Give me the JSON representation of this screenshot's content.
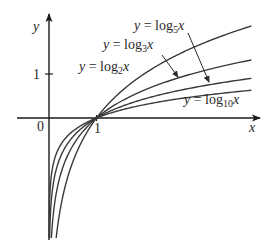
{
  "chart_data": {
    "type": "line",
    "title": "",
    "xlabel": "x",
    "ylabel": "y",
    "origin_label": "0",
    "x_ticks": [
      {
        "value": 1,
        "label": "1"
      }
    ],
    "y_ticks": [
      {
        "value": 1,
        "label": "1"
      }
    ],
    "xlim": [
      0,
      4.26
    ],
    "ylim": [
      -2.72,
      2.1
    ],
    "grid": false,
    "legend": "inline annotations with arrows",
    "series": [
      {
        "name": "y = log2x",
        "base": 2,
        "label_prefix": "y = log",
        "label_sub": "2",
        "label_suffix": "x",
        "points": [
          [
            0.27,
            -1.89
          ],
          [
            0.5,
            -1.0
          ],
          [
            1,
            0
          ],
          [
            2,
            1.0
          ],
          [
            3,
            1.585
          ],
          [
            4,
            2.0
          ],
          [
            4.26,
            2.09
          ]
        ]
      },
      {
        "name": "y = log3x",
        "base": 3,
        "label_prefix": "y = log",
        "label_sub": "3",
        "label_suffix": "x",
        "points": [
          [
            0.05,
            -2.73
          ],
          [
            0.5,
            -0.63
          ],
          [
            1,
            0
          ],
          [
            2,
            0.63
          ],
          [
            3,
            1.0
          ],
          [
            4,
            1.26
          ],
          [
            4.26,
            1.32
          ]
        ]
      },
      {
        "name": "y = log5x",
        "base": 5,
        "label_prefix": "y = log",
        "label_sub": "5",
        "label_suffix": "x",
        "points": [
          [
            0.013,
            -2.7
          ],
          [
            0.5,
            -0.43
          ],
          [
            1,
            0
          ],
          [
            2,
            0.43
          ],
          [
            3,
            0.68
          ],
          [
            4,
            0.86
          ],
          [
            4.26,
            0.9
          ]
        ]
      },
      {
        "name": "y = log10x",
        "base": 10,
        "label_prefix": "y = log",
        "label_sub": "10",
        "label_suffix": "x",
        "points": [
          [
            0.002,
            -2.7
          ],
          [
            0.5,
            -0.3
          ],
          [
            1,
            0
          ],
          [
            2,
            0.3
          ],
          [
            3,
            0.48
          ],
          [
            4,
            0.6
          ],
          [
            4.26,
            0.63
          ]
        ]
      }
    ],
    "annotations": [
      {
        "series": "y = log5x",
        "text_pos_px": [
          134,
          30
        ],
        "arrow_from_px": [
          188,
          33
        ],
        "arrow_to_px": [
          209,
          82
        ]
      },
      {
        "series": "y = log3x",
        "text_pos_px": [
          103,
          49
        ],
        "arrow_from_px": [
          162,
          55
        ],
        "arrow_to_px": [
          178,
          77
        ]
      },
      {
        "series": "y = log2x",
        "text_pos_px": [
          79,
          71
        ],
        "arrow_from_px": null,
        "arrow_to_px": null
      },
      {
        "series": "y = log10x",
        "text_pos_px": [
          184,
          104
        ],
        "arrow_from_px": null,
        "arrow_to_px": null
      }
    ]
  },
  "layout": {
    "origin_px": [
      49,
      118
    ],
    "x_unit_px": 47.5,
    "y_unit_px": 44,
    "x_axis": {
      "from_px": 17,
      "to_px": 260
    },
    "y_axis": {
      "from_px": 240,
      "to_px": 14
    },
    "curve_x_end": 4.26,
    "curve_y_min_px": 238,
    "stroke_color": "#3a3a3a"
  }
}
